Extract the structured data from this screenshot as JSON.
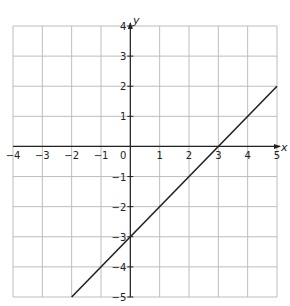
{
  "chart_data": {
    "type": "line",
    "title": "",
    "xlabel": "x",
    "ylabel": "y",
    "xlim": [
      -4,
      5
    ],
    "ylim": [
      -5,
      4
    ],
    "grid": true,
    "x_ticks": [
      -4,
      -3,
      -2,
      -1,
      0,
      1,
      2,
      3,
      4,
      5
    ],
    "y_ticks": [
      4,
      3,
      2,
      1,
      -1,
      -2,
      -3,
      -4,
      -5
    ],
    "series": [
      {
        "name": "y = x - 3",
        "x": [
          -2,
          5
        ],
        "y": [
          -5,
          2
        ],
        "color": "#222222"
      }
    ],
    "legend": null
  },
  "labels": {
    "x_axis": "x",
    "y_axis": "y",
    "x_ticks": [
      "−4",
      "−3",
      "−2",
      "−1",
      "0",
      "1",
      "2",
      "3",
      "4",
      "5"
    ],
    "y_ticks_pos": [
      "4",
      "3",
      "2",
      "1"
    ],
    "y_ticks_neg": [
      "−1",
      "−2",
      "−3",
      "−4",
      "−5"
    ]
  },
  "colors": {
    "grid": "#bdbdbd",
    "axis": "#222222",
    "line": "#222222"
  }
}
